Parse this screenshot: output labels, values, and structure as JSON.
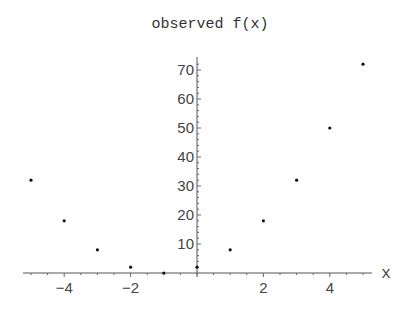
{
  "chart_data": {
    "type": "scatter",
    "title": "observed f(x)",
    "xlabel": "x",
    "ylabel": "",
    "x": [
      -5,
      -4,
      -3,
      -2,
      -1,
      0,
      1,
      2,
      3,
      4,
      5
    ],
    "series": [
      {
        "name": "observed f(x)",
        "values": [
          32,
          18,
          8,
          2,
          0,
          2,
          8,
          18,
          32,
          50,
          72
        ]
      }
    ],
    "xlim": [
      -5.2,
      5.3
    ],
    "ylim": [
      -1,
      74
    ],
    "x_ticks": [
      -4,
      -2,
      2,
      4
    ],
    "x_tick_labels": [
      "-4",
      "-2",
      "2",
      "4"
    ],
    "y_ticks": [
      10,
      20,
      30,
      40,
      50,
      60,
      70
    ],
    "y_tick_labels": [
      "10",
      "20",
      "30",
      "40",
      "50",
      "60",
      "70"
    ],
    "grid": false,
    "legend": "none"
  }
}
